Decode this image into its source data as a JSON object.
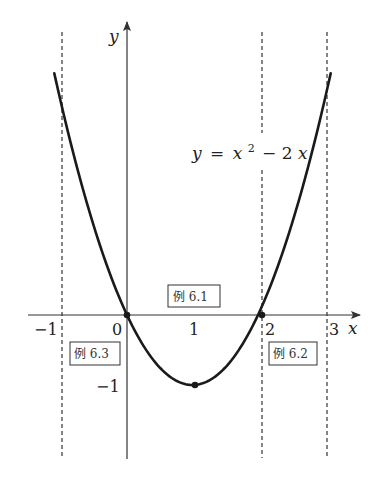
{
  "figure": {
    "function_label": {
      "y": "y",
      "eq": "=",
      "x": "x",
      "exp": "2",
      "rest": "− 2",
      "x2": "x"
    },
    "axes": {
      "x_label": "x",
      "y_label": "y"
    },
    "ticks": {
      "x": [
        {
          "value": -1,
          "label": "−1"
        },
        {
          "value": 0,
          "label": "0"
        },
        {
          "value": 1,
          "label": "1"
        },
        {
          "value": 2,
          "label": "2"
        },
        {
          "value": 3,
          "label": "3"
        }
      ],
      "y": [
        {
          "value": -1,
          "label": "−1"
        }
      ]
    },
    "boxes": {
      "ex61": "例 6.1",
      "ex62": "例 6.2",
      "ex63": "例 6.3"
    },
    "dashed_lines_x": [
      -1,
      2,
      3
    ],
    "marked_points": [
      {
        "x": 0,
        "y": 0
      },
      {
        "x": 2,
        "y": 0
      },
      {
        "x": 1,
        "y": -1
      }
    ],
    "colors": {
      "curve": "#1a1a1a",
      "axis": "#333333",
      "dashed": "#444444"
    }
  },
  "chart_data": {
    "type": "line",
    "xlabel": "x",
    "ylabel": "y",
    "x": [
      -1.1,
      -1,
      -0.5,
      0,
      0.5,
      1,
      1.5,
      2,
      2.5,
      3,
      3.1
    ],
    "series": [
      {
        "name": "y = x^2 - 2x",
        "values": [
          3.41,
          3,
          1.25,
          0,
          -0.75,
          -1,
          -0.75,
          0,
          1.25,
          3,
          3.41
        ]
      }
    ],
    "x_ticks": [
      "-1",
      "0",
      "1",
      "2",
      "3"
    ],
    "y_ticks": [
      "-1"
    ],
    "vertical_dashed_lines": [
      -1,
      2,
      3
    ],
    "points": [
      [
        0,
        0
      ],
      [
        2,
        0
      ],
      [
        1,
        -1
      ]
    ],
    "annotations": [
      {
        "text": "例 6.1",
        "region": "between x=0 and x=2, above x-axis"
      },
      {
        "text": "例 6.2",
        "region": "between x=2 and x=3, below x-axis"
      },
      {
        "text": "例 6.3",
        "region": "between x=-1 and x=0, below x-axis"
      }
    ],
    "xlim": [
      -1.5,
      3.5
    ],
    "ylim": [
      -2.1,
      4.2
    ],
    "grid": false,
    "legend": "none"
  }
}
